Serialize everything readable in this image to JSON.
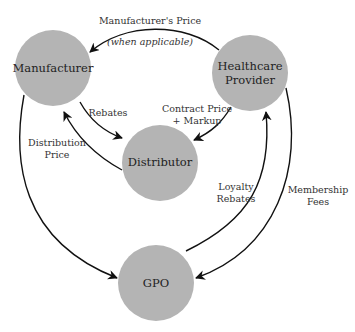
{
  "diagram": {
    "colors": {
      "node_fill": "#b4b4b4",
      "edge": "#111111",
      "text": "#222222",
      "background": "#ffffff"
    },
    "nodes": [
      {
        "id": "manufacturer",
        "label_lines": [
          "Manufacturer"
        ]
      },
      {
        "id": "healthcare-provider",
        "label_lines": [
          "Healthcare",
          "Provider"
        ]
      },
      {
        "id": "distributor",
        "label_lines": [
          "Distributor"
        ]
      },
      {
        "id": "gpo",
        "label_lines": [
          "GPO"
        ]
      }
    ],
    "edges": [
      {
        "id": "manufacturers-price",
        "from": "healthcare-provider",
        "to": "manufacturer",
        "label_lines": [
          "Manufacturer's Price"
        ],
        "note": "(when applicable)"
      },
      {
        "id": "rebates",
        "from": "manufacturer",
        "to": "distributor",
        "label_lines": [
          "Rebates"
        ]
      },
      {
        "id": "distribution-price",
        "from": "distributor",
        "to": "manufacturer",
        "label_lines": [
          "Distribution",
          "Price"
        ]
      },
      {
        "id": "contract-price-markup",
        "from": "healthcare-provider",
        "to": "distributor",
        "label_lines": [
          "Contract Price",
          "+ Markup"
        ]
      },
      {
        "id": "manufacturer-to-gpo",
        "from": "manufacturer",
        "to": "gpo",
        "label_lines": []
      },
      {
        "id": "loyalty-rebates",
        "from": "gpo",
        "to": "healthcare-provider",
        "label_lines": [
          "Loyalty",
          "Rebates"
        ]
      },
      {
        "id": "membership-fees",
        "from": "healthcare-provider",
        "to": "gpo",
        "label_lines": [
          "Membership",
          "Fees"
        ]
      }
    ]
  }
}
